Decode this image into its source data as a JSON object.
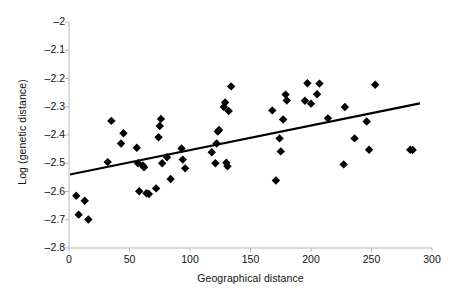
{
  "chart_data": {
    "type": "scatter",
    "title": "",
    "xlabel": "Geographical distance",
    "ylabel": "Log (genetic distance)",
    "xlim": [
      0,
      300
    ],
    "ylim": [
      -2.8,
      -2.0
    ],
    "xticks": [
      "0",
      "50",
      "100",
      "150",
      "200",
      "250",
      "300"
    ],
    "xtick_values": [
      0,
      50,
      100,
      150,
      200,
      250,
      300
    ],
    "yticks": [
      "-2",
      "-2.1",
      "-2.2",
      "-2.3",
      "-2.4",
      "-2.5",
      "-2.6",
      "-2.7",
      "-2.8"
    ],
    "ytick_values": [
      -2.0,
      -2.1,
      -2.2,
      -2.3,
      -2.4,
      -2.5,
      -2.6,
      -2.7,
      -2.8
    ],
    "grid": false,
    "legend": null,
    "marker": "diamond",
    "marker_color": "#000000",
    "line_color": "#000000",
    "series": [
      {
        "name": "samples",
        "x": [
          6,
          8,
          13,
          16,
          32,
          35,
          43,
          45,
          56,
          57,
          58,
          61,
          62,
          64,
          66,
          72,
          74,
          75,
          76,
          77,
          81,
          84,
          93,
          94,
          96,
          118,
          121,
          122,
          123,
          124,
          128,
          129,
          130,
          131,
          132,
          134,
          168,
          171,
          174,
          175,
          177,
          179,
          180,
          195,
          197,
          200,
          205,
          207,
          214,
          227,
          228,
          236,
          246,
          248,
          253,
          282,
          284
        ],
        "y": [
          -2.615,
          -2.682,
          -2.633,
          -2.699,
          -2.496,
          -2.35,
          -2.43,
          -2.394,
          -2.445,
          -2.5,
          -2.599,
          -2.508,
          -2.514,
          -2.606,
          -2.609,
          -2.589,
          -2.408,
          -2.368,
          -2.343,
          -2.5,
          -2.479,
          -2.556,
          -2.448,
          -2.487,
          -2.518,
          -2.461,
          -2.5,
          -2.43,
          -2.388,
          -2.382,
          -2.301,
          -2.285,
          -2.498,
          -2.511,
          -2.315,
          -2.228,
          -2.313,
          -2.561,
          -2.412,
          -2.458,
          -2.345,
          -2.257,
          -2.278,
          -2.279,
          -2.217,
          -2.289,
          -2.256,
          -2.218,
          -2.341,
          -2.504,
          -2.301,
          -2.412,
          -2.352,
          -2.452,
          -2.222,
          -2.452,
          -2.453
        ]
      }
    ],
    "trendline": {
      "name": "linear-fit",
      "x_start": 0.8,
      "y_start": -2.54,
      "x_end": 290,
      "y_end": -2.288
    }
  },
  "axes": {
    "y_title": "Log (genetic distance)",
    "x_title": "Geographical distance"
  }
}
